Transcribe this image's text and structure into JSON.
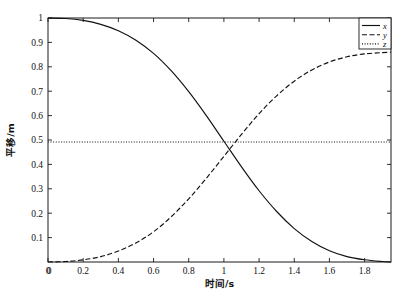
{
  "chart_data": {
    "type": "line",
    "title": "",
    "xlabel": "时间/s",
    "ylabel": "平移/m",
    "xlim": [
      0,
      1.95
    ],
    "ylim": [
      0,
      1.0
    ],
    "grid": false,
    "legend_position": "top-right",
    "xticks": [
      0,
      0.2,
      0.4,
      0.6,
      0.8,
      1,
      1.2,
      1.4,
      1.6,
      1.8
    ],
    "xtick_labels": [
      "0",
      "0.2",
      "0.4",
      "0.6",
      "0.8",
      "1",
      "1.2",
      "1.4",
      "1.6",
      "1.8"
    ],
    "yticks": [
      0.1,
      0.2,
      0.3,
      0.4,
      0.5,
      0.6,
      0.7,
      0.8,
      0.9,
      1
    ],
    "ytick_labels": [
      "0.1",
      "0.2",
      "0.3",
      "0.4",
      "0.5",
      "0.6",
      "0.7",
      "0.8",
      "0.9",
      "1"
    ],
    "ybottom_label": "0",
    "x": [
      0,
      0.1,
      0.2,
      0.3,
      0.4,
      0.5,
      0.6,
      0.7,
      0.8,
      0.9,
      1.0,
      1.1,
      1.2,
      1.3,
      1.4,
      1.5,
      1.6,
      1.7,
      1.8,
      1.9,
      1.95
    ],
    "series": [
      {
        "name": "x",
        "style": "solid",
        "color": "#111111",
        "values": [
          1.0,
          0.998,
          0.99,
          0.974,
          0.948,
          0.909,
          0.855,
          0.784,
          0.698,
          0.6,
          0.495,
          0.39,
          0.292,
          0.207,
          0.137,
          0.084,
          0.046,
          0.022,
          0.009,
          0.002,
          0.0
        ]
      },
      {
        "name": "y",
        "style": "dashed",
        "color": "#111111",
        "values": [
          0.0,
          0.002,
          0.009,
          0.022,
          0.045,
          0.078,
          0.124,
          0.185,
          0.259,
          0.343,
          0.433,
          0.523,
          0.608,
          0.681,
          0.741,
          0.787,
          0.82,
          0.841,
          0.853,
          0.858,
          0.86
        ]
      },
      {
        "name": "z",
        "style": "dotted",
        "color": "#111111",
        "values": [
          0.492,
          0.492,
          0.492,
          0.492,
          0.492,
          0.492,
          0.492,
          0.492,
          0.492,
          0.492,
          0.492,
          0.492,
          0.492,
          0.492,
          0.492,
          0.492,
          0.492,
          0.492,
          0.492,
          0.492,
          0.492
        ]
      }
    ],
    "legend": [
      {
        "label": "x",
        "style": "solid"
      },
      {
        "label": "y",
        "style": "dashed"
      },
      {
        "label": "z",
        "style": "dotted"
      }
    ]
  }
}
